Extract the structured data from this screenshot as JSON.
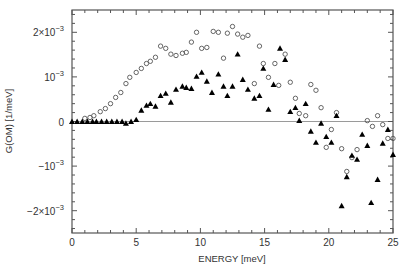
{
  "chart_data": {
    "type": "scatter",
    "title": "",
    "xlabel": "ENERGY  [meV]",
    "ylabel": "G(OM)  [1/meV]",
    "xlim": [
      0,
      25
    ],
    "ylim": [
      -0.0025,
      0.0025
    ],
    "grid": false,
    "legend": null,
    "x_ticks": [
      0,
      5,
      10,
      15,
      20,
      25
    ],
    "x_tick_labels": [
      "0",
      "5",
      "10",
      "15",
      "20",
      "25"
    ],
    "y_ticks": [
      0.002,
      0.001,
      0,
      -0.001,
      -0.002
    ],
    "y_tick_labels": [
      {
        "mant": "2×10",
        "exp": "−3"
      },
      {
        "mant": "10",
        "exp": "−3"
      },
      {
        "mant": "0",
        "exp": ""
      },
      {
        "mant": "−10",
        "exp": "−3"
      },
      {
        "mant": "−2×10",
        "exp": "−3"
      }
    ],
    "reference_line": {
      "y": 0,
      "color": "#9a9a9a"
    },
    "series": [
      {
        "name": "open circles",
        "marker": "circle-open",
        "color": "#555555",
        "unit_scale": "1e-3",
        "points": [
          [
            1.0,
            0.07
          ],
          [
            1.4,
            0.09
          ],
          [
            1.7,
            0.13
          ],
          [
            2.2,
            0.22
          ],
          [
            2.6,
            0.29
          ],
          [
            3.0,
            0.4
          ],
          [
            3.4,
            0.54
          ],
          [
            3.8,
            0.65
          ],
          [
            4.2,
            0.85
          ],
          [
            4.5,
            0.99
          ],
          [
            5.0,
            1.1
          ],
          [
            5.4,
            1.19
          ],
          [
            5.8,
            1.3
          ],
          [
            6.1,
            1.35
          ],
          [
            6.5,
            1.44
          ],
          [
            6.9,
            1.69
          ],
          [
            7.3,
            1.64
          ],
          [
            7.7,
            1.51
          ],
          [
            8.1,
            1.48
          ],
          [
            8.6,
            1.53
          ],
          [
            8.9,
            1.55
          ],
          [
            9.3,
            1.78
          ],
          [
            9.7,
            2.0
          ],
          [
            10.1,
            1.64
          ],
          [
            10.5,
            1.66
          ],
          [
            11.0,
            2.02
          ],
          [
            11.4,
            2.0
          ],
          [
            11.8,
            1.42
          ],
          [
            12.1,
            1.98
          ],
          [
            12.5,
            2.13
          ],
          [
            12.9,
            1.96
          ],
          [
            13.3,
            1.89
          ],
          [
            13.7,
            1.93
          ],
          [
            14.2,
            0.85
          ],
          [
            14.6,
            1.69
          ],
          [
            14.9,
            1.3
          ],
          [
            15.3,
            0.99
          ],
          [
            15.8,
            1.3
          ],
          [
            16.1,
            0.81
          ],
          [
            16.6,
            1.51
          ],
          [
            17.0,
            0.88
          ],
          [
            17.4,
            0.52
          ],
          [
            17.7,
            0.18
          ],
          [
            18.2,
            0.13
          ],
          [
            18.6,
            0.83
          ],
          [
            19.0,
            0.7
          ],
          [
            19.4,
            0.31
          ],
          [
            19.8,
            -0.58
          ],
          [
            20.2,
            -0.18
          ],
          [
            20.6,
            0.2
          ],
          [
            21.0,
            -0.61
          ],
          [
            21.4,
            -1.12
          ],
          [
            21.8,
            -0.81
          ],
          [
            22.2,
            -0.63
          ],
          [
            23.0,
            0.02
          ],
          [
            23.4,
            -0.11
          ],
          [
            23.8,
            0.13
          ],
          [
            24.2,
            -0.07
          ],
          [
            24.6,
            -0.38
          ],
          [
            25.0,
            -0.38
          ]
        ]
      },
      {
        "name": "filled triangles",
        "marker": "triangle-filled",
        "color": "#000000",
        "unit_scale": "1e-3",
        "points": [
          [
            0.0,
            0
          ],
          [
            0.4,
            0
          ],
          [
            0.8,
            0
          ],
          [
            1.2,
            0
          ],
          [
            1.6,
            0
          ],
          [
            1.9,
            0
          ],
          [
            2.3,
            0
          ],
          [
            2.7,
            0
          ],
          [
            3.1,
            0
          ],
          [
            3.5,
            0
          ],
          [
            3.9,
            0
          ],
          [
            4.2,
            -0.04
          ],
          [
            4.6,
            0.0
          ],
          [
            5.0,
            0.04
          ],
          [
            5.4,
            0.25
          ],
          [
            5.8,
            0.36
          ],
          [
            6.1,
            0.4
          ],
          [
            6.5,
            0.34
          ],
          [
            6.9,
            0.58
          ],
          [
            7.3,
            0.63
          ],
          [
            7.7,
            0.43
          ],
          [
            8.1,
            0.72
          ],
          [
            8.6,
            0.79
          ],
          [
            8.9,
            0.76
          ],
          [
            9.3,
            0.74
          ],
          [
            9.7,
            1.01
          ],
          [
            10.1,
            1.1
          ],
          [
            10.5,
            0.9
          ],
          [
            10.9,
            0.65
          ],
          [
            11.4,
            1.06
          ],
          [
            11.8,
            0.79
          ],
          [
            12.1,
            0.58
          ],
          [
            12.5,
            0.79
          ],
          [
            12.9,
            1.51
          ],
          [
            13.3,
            0.94
          ],
          [
            13.7,
            0.72
          ],
          [
            14.2,
            0.52
          ],
          [
            14.6,
            0.58
          ],
          [
            14.9,
            1.19
          ],
          [
            15.3,
            0.27
          ],
          [
            15.7,
            0.83
          ],
          [
            16.2,
            1.64
          ],
          [
            16.6,
            1.39
          ],
          [
            17.0,
            0.22
          ],
          [
            17.4,
            0.31
          ],
          [
            17.7,
            0.02
          ],
          [
            18.2,
            0.4
          ],
          [
            18.6,
            -0.22
          ],
          [
            19.0,
            -0.47
          ],
          [
            19.4,
            -0.04
          ],
          [
            19.8,
            -0.34
          ],
          [
            20.2,
            -0.47
          ],
          [
            20.6,
            0.13
          ],
          [
            21.0,
            -1.89
          ],
          [
            21.4,
            -1.24
          ],
          [
            21.8,
            -0.76
          ],
          [
            22.2,
            -0.85
          ],
          [
            22.6,
            -0.29
          ],
          [
            23.0,
            -0.54
          ],
          [
            23.3,
            -1.82
          ],
          [
            23.8,
            -1.3
          ],
          [
            24.2,
            -0.49
          ],
          [
            24.6,
            -0.18
          ],
          [
            25.0,
            -0.74
          ]
        ]
      }
    ]
  }
}
